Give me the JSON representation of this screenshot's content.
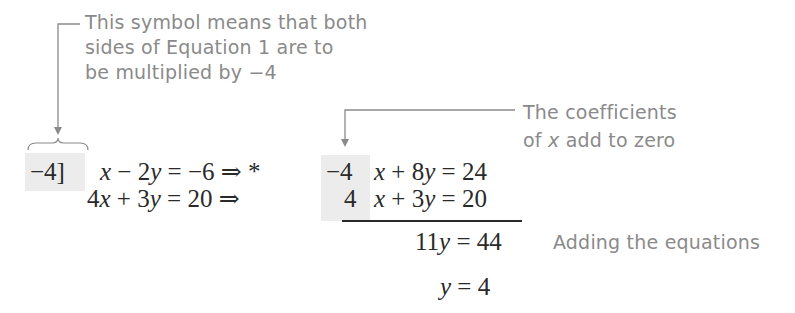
{
  "annotations": {
    "top": {
      "lines": [
        "This symbol means that both",
        "sides of Equation 1 are to",
        "be multiplied by −4"
      ]
    },
    "coefficients": {
      "line1": "The coefficients",
      "line2_pre": "of ",
      "line2_var": "x",
      "line2_post": " add to zero"
    },
    "adding": "Adding the equations"
  },
  "equations": {
    "multiplier": "−4]",
    "row1": {
      "lhs": [
        "x",
        " − 2",
        "y",
        " = −6 ⇒ *"
      ],
      "coef": "−4",
      "rhs": [
        "x",
        " + 8",
        "y",
        " = 24"
      ]
    },
    "row2": {
      "lhs": [
        "4",
        "x",
        " + 3",
        "y",
        " =  20 ⇒"
      ],
      "coef": "4",
      "rhs": [
        "x",
        " + 3",
        "y",
        " = 20"
      ]
    },
    "sum": {
      "pre": "11",
      "var": "y",
      "post": " = 44"
    },
    "result": {
      "var": "y",
      "post": " = 4"
    }
  },
  "colors": {
    "annotation": "#8a8a8a",
    "math": "#2a2a2a",
    "shade": "#ececec"
  }
}
